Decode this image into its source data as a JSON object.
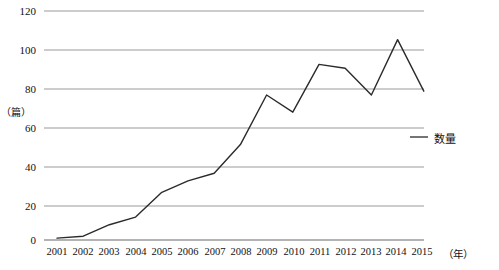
{
  "chart_data": {
    "type": "line",
    "title": "",
    "xlabel": "（年）",
    "ylabel": "（篇）",
    "x": [
      "2001",
      "2002",
      "2003",
      "2004",
      "2005",
      "2006",
      "2007",
      "2008",
      "2009",
      "2010",
      "2011",
      "2012",
      "2013",
      "2014",
      "2015"
    ],
    "categories": [
      "2001",
      "2002",
      "2003",
      "2004",
      "2005",
      "2006",
      "2007",
      "2008",
      "2009",
      "2010",
      "2011",
      "2012",
      "2013",
      "2014",
      "2015"
    ],
    "series": [
      {
        "name": "数量",
        "values": [
          1,
          2,
          8,
          12,
          25,
          31,
          35,
          50,
          76,
          67,
          92,
          90,
          76,
          105,
          78
        ]
      }
    ],
    "values": [
      1,
      2,
      8,
      12,
      25,
      31,
      35,
      50,
      76,
      67,
      92,
      90,
      76,
      105,
      78
    ],
    "ylim": [
      0,
      120
    ],
    "yticks": [
      0,
      20,
      40,
      60,
      80,
      100,
      120
    ],
    "ytick_labels": [
      "0",
      "20",
      "40",
      "60",
      "80",
      "100",
      "120"
    ],
    "grid": "horizontal",
    "legend_position": "right",
    "line_color": "#2b2b2b",
    "grid_color": "#9a9a9a"
  },
  "axes": {
    "y_unit": "（篇）",
    "x_unit": "（年）"
  },
  "legend": {
    "entries": [
      {
        "label": "数量",
        "color": "#2b2b2b"
      }
    ]
  }
}
